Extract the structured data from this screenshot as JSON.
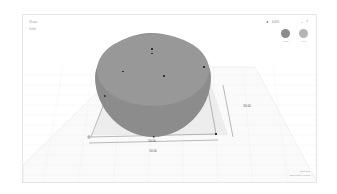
{
  "app": {
    "panel_labels": [
      "Shape",
      "Solid"
    ]
  },
  "toolbar": {
    "undo_icon": "arrow-left-icon",
    "zoom_label": "100%",
    "lock_icon": "lock-icon",
    "help_icon": "help-icon"
  },
  "swatches": [
    {
      "label": "Solid",
      "color": "#8c8c8c"
    },
    {
      "label": "Hole",
      "color": "#b4b4b4"
    }
  ],
  "object": {
    "color": "#8f8f8f",
    "top_color": "#9a9a9a"
  },
  "dimensions": {
    "width": "50.00",
    "depth": "50.00",
    "height_label": "30.00"
  },
  "status": {
    "grid_label": "Edit Grid",
    "snap_label": "Snap Grid 1.0 mm"
  }
}
